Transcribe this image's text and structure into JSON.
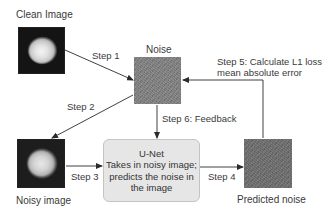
{
  "diagram": {
    "nodes": {
      "clean_image": {
        "label": "Clean Image"
      },
      "noise": {
        "label": "Noise"
      },
      "noisy_image": {
        "label": "Noisy image"
      },
      "unet": {
        "title": "U-Net",
        "line1": "Takes in noisy image;",
        "line2": "predicts the noise in",
        "line3": "the image"
      },
      "predicted_noise": {
        "label": "Predicted noise"
      }
    },
    "edges": {
      "step1": "Step 1",
      "step2": "Step 2",
      "step3": "Step 3",
      "step4": "Step 4",
      "step5_line1": "Step 5: Calculate L1 loss",
      "step5_line2": "mean absolute error",
      "step6": "Step 6: Feedback"
    },
    "colors": {
      "arrow": "#2b2b2b",
      "unet_fill": "#e6e6e6",
      "noise_fill": "#7f7f7f"
    }
  }
}
